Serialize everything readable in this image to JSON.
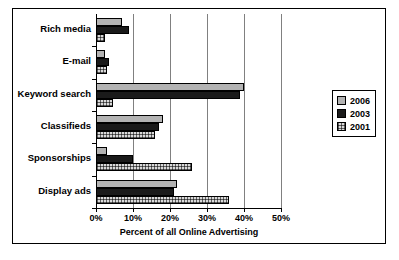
{
  "chart_data": {
    "type": "bar",
    "orientation": "horizontal",
    "title": "",
    "xlabel": "Percent of all Online Advertising",
    "ylabel": "",
    "xlim": [
      0,
      50
    ],
    "x_tick_labels": [
      "0%",
      "10%",
      "20%",
      "30%",
      "40%",
      "50%"
    ],
    "x_tick_values": [
      0,
      10,
      20,
      30,
      40,
      50
    ],
    "grid": true,
    "legend_position": "right",
    "categories": [
      "Rich media",
      "E-mail",
      "Keyword search",
      "Classifieds",
      "Sponsorships",
      "Display ads"
    ],
    "series": [
      {
        "name": "2006",
        "color": "#b3b3b3",
        "values": [
          7,
          2.5,
          40,
          18,
          3,
          22
        ]
      },
      {
        "name": "2003",
        "color": "#1a1a1a",
        "values": [
          9,
          3.5,
          39,
          17,
          10,
          21
        ]
      },
      {
        "name": "2001",
        "color": "#d9d9d9",
        "values": [
          2.5,
          3,
          4.5,
          16,
          26,
          36
        ]
      }
    ]
  },
  "legend": {
    "entries": [
      {
        "label": "2006",
        "swatch": "legend-swatch-2006"
      },
      {
        "label": "2003",
        "swatch": "legend-swatch-2003"
      },
      {
        "label": "2001",
        "swatch": "legend-swatch-2001"
      }
    ]
  }
}
